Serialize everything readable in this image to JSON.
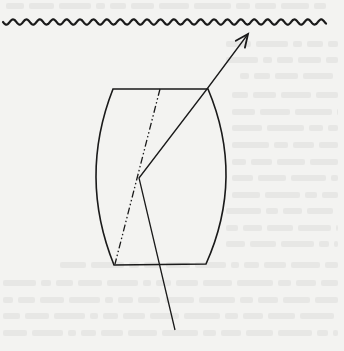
{
  "figure": {
    "colors": {
      "paper": "#f3f3f1",
      "ink": "#1a1a1a",
      "bleed_through": "#d9d9d6"
    },
    "surface": {
      "kind": "wavy-line",
      "x_start": 3,
      "x_end": 326,
      "y": 22,
      "amplitude": 2.6,
      "period": 13.4
    },
    "barrel": {
      "top_left": [
        113,
        89
      ],
      "top_right": [
        208,
        89
      ],
      "bottom_left": [
        114,
        265
      ],
      "bottom_right": [
        206,
        264
      ],
      "left_bulge_x": 96,
      "right_bulge_x": 226
    },
    "axis_line": {
      "style": "dash-dot",
      "from": [
        160,
        89
      ],
      "to": [
        115,
        264
      ]
    },
    "ray": {
      "points": [
        [
          175,
          330
        ],
        [
          139,
          178
        ],
        [
          207,
          89
        ],
        [
          248,
          34
        ]
      ],
      "arrowhead": "open-arrow-at-end"
    }
  },
  "bleed_through_lines": [
    {
      "x": 6,
      "y": 6,
      "w": 320
    },
    {
      "x": 226,
      "y": 44,
      "w": 112
    },
    {
      "x": 226,
      "y": 60,
      "w": 112
    },
    {
      "x": 240,
      "y": 76,
      "w": 98
    },
    {
      "x": 232,
      "y": 95,
      "w": 106
    },
    {
      "x": 232,
      "y": 112,
      "w": 106
    },
    {
      "x": 232,
      "y": 128,
      "w": 106
    },
    {
      "x": 232,
      "y": 145,
      "w": 106
    },
    {
      "x": 232,
      "y": 162,
      "w": 106
    },
    {
      "x": 232,
      "y": 178,
      "w": 106
    },
    {
      "x": 232,
      "y": 195,
      "w": 106
    },
    {
      "x": 226,
      "y": 211,
      "w": 112
    },
    {
      "x": 226,
      "y": 228,
      "w": 112
    },
    {
      "x": 226,
      "y": 244,
      "w": 112
    },
    {
      "x": 60,
      "y": 265,
      "w": 278
    },
    {
      "x": 3,
      "y": 283,
      "w": 335
    },
    {
      "x": 3,
      "y": 300,
      "w": 335
    },
    {
      "x": 3,
      "y": 316,
      "w": 335
    },
    {
      "x": 3,
      "y": 333,
      "w": 335
    }
  ]
}
